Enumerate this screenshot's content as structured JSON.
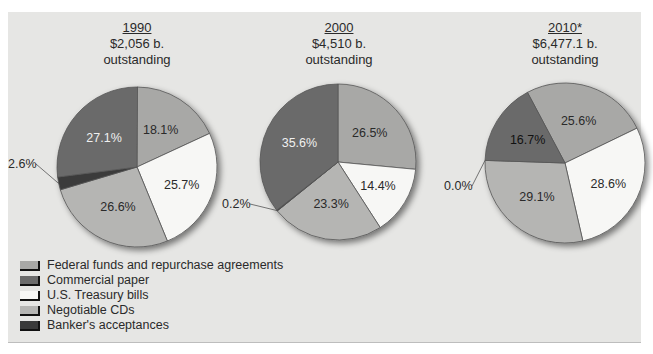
{
  "colors": {
    "federal_funds": "#a8a8a6",
    "commercial_paper": "#6b6b6b",
    "treasury_bills": "#f7f7f5",
    "negotiable_cds": "#b5b5b3",
    "bankers_acceptances": "#3a3a3a",
    "panel_bg": "#e6e6e4"
  },
  "charts": [
    {
      "year": "1990",
      "amount": "$2,056 b.",
      "sub": "outstanding"
    },
    {
      "year": "2000",
      "amount": "$4,510 b.",
      "sub": "outstanding"
    },
    {
      "year": "2010*",
      "amount": "$6,477.1 b.",
      "sub": "outstanding"
    }
  ],
  "legend": [
    {
      "label": "Federal funds and repurchase agreements",
      "key": "federal_funds"
    },
    {
      "label": "Commercial paper",
      "key": "commercial_paper"
    },
    {
      "label": "U.S. Treasury bills",
      "key": "treasury_bills"
    },
    {
      "label": "Negotiable CDs",
      "key": "negotiable_cds"
    },
    {
      "label": "Banker's acceptances",
      "key": "bankers_acceptances"
    }
  ],
  "chart_data": [
    {
      "type": "pie",
      "title": "1990 $2,056 b. outstanding",
      "categories": [
        "Federal funds and repurchase agreements",
        "U.S. Treasury bills",
        "Negotiable CDs",
        "Banker's acceptances",
        "Commercial paper"
      ],
      "values": [
        18.1,
        25.7,
        26.6,
        2.6,
        27.1
      ],
      "labels": [
        "18.1%",
        "25.7%",
        "26.6%",
        "2.6%",
        "27.1%"
      ]
    },
    {
      "type": "pie",
      "title": "2000 $4,510 b. outstanding",
      "categories": [
        "Federal funds and repurchase agreements",
        "U.S. Treasury bills",
        "Negotiable CDs",
        "Banker's acceptances",
        "Commercial paper"
      ],
      "values": [
        26.5,
        14.4,
        23.3,
        0.2,
        35.6
      ],
      "labels": [
        "26.5%",
        "14.4%",
        "23.3%",
        "0.2%",
        "35.6%"
      ]
    },
    {
      "type": "pie",
      "title": "2010* $6,477.1 b. outstanding",
      "categories": [
        "Federal funds and repurchase agreements",
        "U.S. Treasury bills",
        "Negotiable CDs",
        "Banker's acceptances",
        "Commercial paper"
      ],
      "values": [
        25.6,
        28.6,
        29.1,
        0.0,
        16.7
      ],
      "labels": [
        "25.6%",
        "28.6%",
        "29.1%",
        "0.0%",
        "16.7%"
      ]
    }
  ]
}
